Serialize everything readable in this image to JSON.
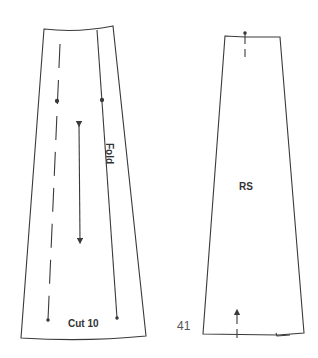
{
  "figure": {
    "page_number": "41",
    "colors": {
      "line": "#3a3a3a",
      "text": "#333333",
      "background": "#ffffff"
    },
    "pieces": [
      {
        "id": "left-panel",
        "labels": {
          "cut": "Cut 10",
          "fold": "Fold"
        },
        "markings": [
          "grainline-double-arrow",
          "dashed-stitch-line",
          "fold-line",
          "balance-dots"
        ]
      },
      {
        "id": "right-panel",
        "labels": {
          "side": "RS"
        },
        "markings": [
          "top-notch",
          "bottom-notch-grain-arrow"
        ]
      }
    ]
  }
}
